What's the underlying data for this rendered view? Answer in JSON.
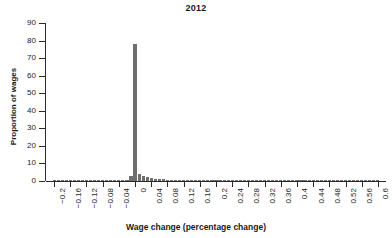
{
  "chart_data": {
    "type": "bar",
    "title": "2012",
    "xlabel": "Wage change (percentage change)",
    "ylabel": "Proportion of wages",
    "grid": false,
    "legend": null,
    "xlim": [
      -0.22,
      0.62
    ],
    "ylim": [
      0,
      90
    ],
    "bin_width": 0.01,
    "xtick_labels": [
      "−0.2",
      "−0.16",
      "−0.12",
      "−0.08",
      "−0.04",
      "0",
      "0.04",
      "0.08",
      "0.12",
      "0.16",
      "0.2",
      "0.24",
      "0.28",
      "0.32",
      "0.36",
      "0.4",
      "0.44",
      "0.48",
      "0.52",
      "0.56",
      "0.6"
    ],
    "xtick_values": [
      -0.2,
      -0.16,
      -0.12,
      -0.08,
      -0.04,
      0,
      0.04,
      0.08,
      0.12,
      0.16,
      0.2,
      0.24,
      0.28,
      0.32,
      0.36,
      0.4,
      0.44,
      0.48,
      0.52,
      0.56,
      0.6
    ],
    "ytick_labels": [
      "0",
      "10",
      "20",
      "30",
      "40",
      "50",
      "60",
      "70",
      "80",
      "90"
    ],
    "ytick_values": [
      0,
      10,
      20,
      30,
      40,
      50,
      60,
      70,
      80,
      90
    ],
    "x": [
      -0.2,
      -0.19,
      -0.18,
      -0.17,
      -0.16,
      -0.15,
      -0.14,
      -0.13,
      -0.12,
      -0.11,
      -0.1,
      -0.09,
      -0.08,
      -0.07,
      -0.06,
      -0.05,
      -0.04,
      -0.03,
      -0.02,
      -0.01,
      0.0,
      0.01,
      0.02,
      0.03,
      0.04,
      0.05,
      0.06,
      0.07,
      0.08,
      0.09,
      0.1,
      0.11,
      0.12,
      0.13,
      0.14,
      0.15,
      0.16,
      0.17,
      0.18,
      0.19,
      0.2,
      0.21,
      0.22,
      0.23,
      0.24,
      0.25,
      0.26,
      0.27,
      0.28,
      0.29,
      0.3,
      0.31,
      0.32,
      0.33,
      0.34,
      0.35,
      0.36,
      0.37,
      0.38,
      0.39,
      0.4,
      0.41,
      0.42,
      0.43,
      0.44,
      0.45,
      0.46,
      0.47,
      0.48,
      0.49,
      0.5,
      0.51,
      0.52,
      0.53,
      0.54,
      0.55,
      0.56,
      0.57,
      0.58,
      0.59,
      0.6
    ],
    "values": [
      0.7,
      0.1,
      0.1,
      0.1,
      0.1,
      0.1,
      0.1,
      0.1,
      0.1,
      0.1,
      0.1,
      0.1,
      0.1,
      0.1,
      0.1,
      0.1,
      0.1,
      0.1,
      0.15,
      2.6,
      78.0,
      4.2,
      3.0,
      2.3,
      1.7,
      1.3,
      1.0,
      0.9,
      0.8,
      0.7,
      0.6,
      0.55,
      0.5,
      0.45,
      0.4,
      0.38,
      0.35,
      0.32,
      0.3,
      0.28,
      0.26,
      0.25,
      0.23,
      0.22,
      0.2,
      0.19,
      0.18,
      0.17,
      0.16,
      0.15,
      0.14,
      0.13,
      0.13,
      0.12,
      0.12,
      0.11,
      0.11,
      0.1,
      0.1,
      0.1,
      0.1,
      0.09,
      0.09,
      0.09,
      0.08,
      0.08,
      0.08,
      0.07,
      0.07,
      0.07,
      0.06,
      0.06,
      0.06,
      0.05,
      0.05,
      0.05,
      0.05,
      0.04,
      0.04,
      0.04,
      0.04
    ],
    "bar_color": "#6f6f6f",
    "axis_color": "#2b2b2b",
    "background_color": "#ffffff"
  }
}
